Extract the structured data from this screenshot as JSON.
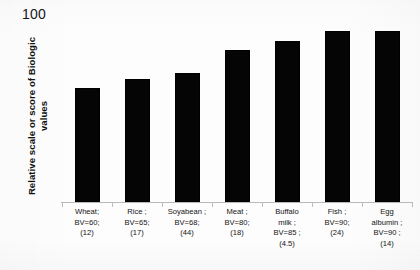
{
  "chart_data": {
    "type": "bar",
    "title": "",
    "xlabel": "",
    "ylabel": "Relative scale or score of Biologic values",
    "ylim": [
      0,
      100
    ],
    "ytick_labels": [
      "100"
    ],
    "grid": false,
    "legend": null,
    "bar_color": "#050505",
    "background_color": "#fdfdfd",
    "axis_color": "#b9b9b9",
    "categories": [
      "Wheat",
      "Rice",
      "Soyabean",
      "Meat",
      "Buffalo milk",
      "Fish",
      "Egg albumin"
    ],
    "values": [
      60,
      65,
      68,
      80,
      85,
      90,
      90
    ],
    "secondary_values": [
      12,
      17,
      44,
      18,
      4.5,
      24,
      14
    ],
    "tick_labels": [
      [
        "Wheat;",
        "BV=60;",
        "(12)"
      ],
      [
        "Rice ;",
        "BV=65;",
        "(17)"
      ],
      [
        "Soyabean ;",
        "BV=68;",
        "(44)"
      ],
      [
        "Meat ;",
        "BV=80;",
        "(18)"
      ],
      [
        "Buffalo",
        "milk ;",
        "BV=85 ;",
        "(4.5)"
      ],
      [
        "Fish ;",
        "BV=90;",
        "(24)"
      ],
      [
        "Egg",
        "albumin ;",
        "BV=90 ;",
        "(14)"
      ]
    ]
  },
  "axis": {
    "y_max_label": "100",
    "y_title": "Relative scale or score of Biologic values"
  }
}
